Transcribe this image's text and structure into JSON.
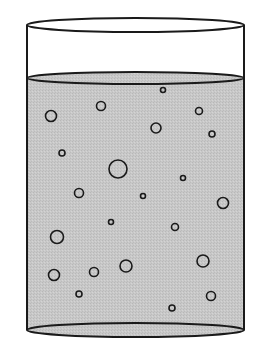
{
  "diagram": {
    "title": "",
    "colors": {
      "background": "#ffffff",
      "outline": "#1a1a1a",
      "liquid": "#c8c8c8",
      "bubble_fill": "#c8c8c8"
    },
    "cylinder": {
      "left_x": 27,
      "right_x": 244,
      "top_cy": 25,
      "top_ry": 7,
      "surface_cy": 78,
      "surface_ry": 6,
      "bottom_cy": 330,
      "bottom_ry": 7
    },
    "bubbles": [
      {
        "cx": 163,
        "cy": 90,
        "r": 2.5
      },
      {
        "cx": 101,
        "cy": 106,
        "r": 4.5
      },
      {
        "cx": 51,
        "cy": 116,
        "r": 5.5
      },
      {
        "cx": 199,
        "cy": 111,
        "r": 3.5
      },
      {
        "cx": 156,
        "cy": 128,
        "r": 5
      },
      {
        "cx": 212,
        "cy": 134,
        "r": 3
      },
      {
        "cx": 62,
        "cy": 153,
        "r": 3
      },
      {
        "cx": 118,
        "cy": 169,
        "r": 9
      },
      {
        "cx": 183,
        "cy": 178,
        "r": 2.5
      },
      {
        "cx": 79,
        "cy": 193,
        "r": 4.5
      },
      {
        "cx": 143,
        "cy": 196,
        "r": 2.5
      },
      {
        "cx": 223,
        "cy": 203,
        "r": 5.5
      },
      {
        "cx": 111,
        "cy": 222,
        "r": 2.5
      },
      {
        "cx": 175,
        "cy": 227,
        "r": 3.5
      },
      {
        "cx": 57,
        "cy": 237,
        "r": 6.5
      },
      {
        "cx": 54,
        "cy": 275,
        "r": 5.5
      },
      {
        "cx": 94,
        "cy": 272,
        "r": 4.5
      },
      {
        "cx": 126,
        "cy": 266,
        "r": 6
      },
      {
        "cx": 203,
        "cy": 261,
        "r": 6
      },
      {
        "cx": 79,
        "cy": 294,
        "r": 3
      },
      {
        "cx": 211,
        "cy": 296,
        "r": 4.5
      },
      {
        "cx": 172,
        "cy": 308,
        "r": 3
      }
    ]
  }
}
